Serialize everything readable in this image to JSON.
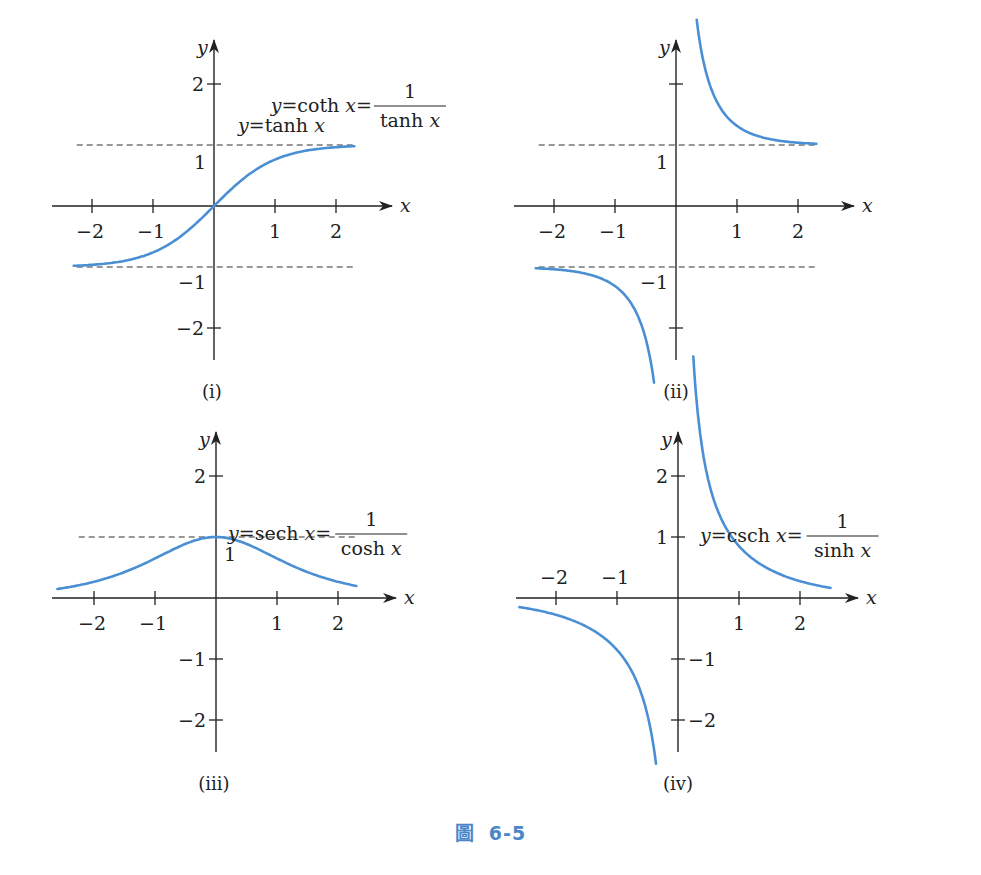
{
  "figure": {
    "caption_prefix": "圖",
    "caption_number": "6-5",
    "caption_color": "#4a86c8",
    "curve_color": "#4a8fd4"
  },
  "chart_data": [
    {
      "type": "line",
      "panel": "(i)",
      "title": "y = tanh x",
      "formula": {
        "lhs": "y=tanh x",
        "num": "",
        "den": ""
      },
      "xlabel": "x",
      "ylabel": "y",
      "xlim": [
        -2.3,
        2.3
      ],
      "ylim": [
        -2.6,
        2.6
      ],
      "xticks": [
        -2,
        -1,
        1,
        2
      ],
      "yticks": [
        -2,
        -1,
        1,
        2
      ],
      "asymptotes_y": [
        1,
        -1
      ],
      "series": [
        {
          "name": "tanh x",
          "domain": [
            -2.3,
            2.3
          ],
          "x": [
            -2,
            -1,
            0,
            1,
            2
          ],
          "values": [
            -0.96,
            -0.76,
            0,
            0.76,
            0.96
          ]
        }
      ]
    },
    {
      "type": "line",
      "panel": "(ii)",
      "title": "y = coth x = 1 / tanh x",
      "formula": {
        "lhs": "y=coth x=",
        "num": "1",
        "den": "tanh x"
      },
      "xlabel": "x",
      "ylabel": "y",
      "xlim": [
        -2.3,
        2.3
      ],
      "ylim": [
        -2.6,
        2.6
      ],
      "xticks": [
        -2,
        -1,
        1,
        2
      ],
      "yticks": [
        -2,
        -1,
        1,
        2
      ],
      "asymptotes_y": [
        1,
        -1
      ],
      "series": [
        {
          "name": "coth x",
          "domain": [
            0.35,
            2.3
          ],
          "x": [
            0.5,
            1,
            2
          ],
          "values": [
            2.16,
            1.31,
            1.04
          ]
        },
        {
          "name": "coth x (neg)",
          "domain": [
            -2.3,
            -0.35
          ],
          "x": [
            -2,
            -1,
            -0.5
          ],
          "values": [
            -1.04,
            -1.31,
            -2.16
          ]
        }
      ]
    },
    {
      "type": "line",
      "panel": "(iii)",
      "title": "y = sech x = 1 / cosh x",
      "formula": {
        "lhs": "y=sech x=",
        "num": "1",
        "den": "cosh x"
      },
      "xlabel": "x",
      "ylabel": "y",
      "xlim": [
        -2.6,
        2.3
      ],
      "ylim": [
        -2.6,
        2.6
      ],
      "xticks": [
        -2,
        -1,
        1,
        2
      ],
      "yticks": [
        -2,
        -1,
        1,
        2
      ],
      "asymptotes_y": [
        1
      ],
      "series": [
        {
          "name": "sech x",
          "domain": [
            -2.6,
            2.3
          ],
          "x": [
            -2,
            -1,
            0,
            1,
            2
          ],
          "values": [
            0.27,
            0.65,
            1,
            0.65,
            0.27
          ]
        }
      ]
    },
    {
      "type": "line",
      "panel": "(iv)",
      "title": "y = csch x = 1 / sinh x",
      "formula": {
        "lhs": "y=csch x=",
        "num": "1",
        "den": "sinh x"
      },
      "xlabel": "x",
      "ylabel": "y",
      "xlim": [
        -2.6,
        2.5
      ],
      "ylim": [
        -2.6,
        2.6
      ],
      "xticks": [
        -2,
        -1,
        1,
        2
      ],
      "yticks": [
        -2,
        -1,
        1,
        2
      ],
      "asymptotes_y": [],
      "series": [
        {
          "name": "csch x",
          "domain": [
            0.25,
            2.5
          ],
          "x": [
            0.5,
            1,
            2
          ],
          "values": [
            1.92,
            0.85,
            0.28
          ]
        },
        {
          "name": "csch x (neg)",
          "domain": [
            -2.6,
            -0.35
          ],
          "x": [
            -2,
            -1,
            -0.5
          ],
          "values": [
            -0.28,
            -0.85,
            -1.92
          ]
        }
      ]
    }
  ],
  "labels": {
    "i": "(i)",
    "ii": "(ii)",
    "iii": "(iii)",
    "iv": "(iv)",
    "x": "x",
    "y": "y",
    "t_m2": "−2",
    "t_m1": "−1",
    "t_1": "1",
    "t_2": "2"
  }
}
